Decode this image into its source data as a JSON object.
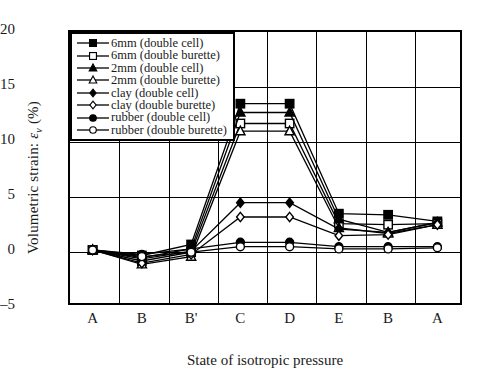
{
  "chart_data": {
    "type": "line",
    "title": "",
    "xlabel": "State of isotropic pressure",
    "ylabel": "Volumetric strain: εv (%)",
    "ylabel_parts": {
      "prefix": "Volumetric strain: ",
      "symbol": "ε",
      "subscript": "v",
      "unit": " (%)"
    },
    "categories": [
      "A",
      "B",
      "B'",
      "C",
      "D",
      "E",
      "B",
      "A"
    ],
    "ylim": [
      -5,
      20
    ],
    "yticks": [
      20,
      15,
      10,
      5,
      0,
      -5
    ],
    "grid": true,
    "legend_position": "top-left",
    "series": [
      {
        "name": "6mm (double cell)",
        "marker": "filled-square",
        "values": [
          0.0,
          -0.5,
          0.5,
          13.3,
          13.3,
          3.3,
          3.2,
          2.6
        ]
      },
      {
        "name": "6mm (double burette)",
        "marker": "open-square",
        "values": [
          0.0,
          -1.0,
          -0.2,
          11.5,
          11.5,
          2.4,
          2.3,
          2.4
        ]
      },
      {
        "name": "2mm (double cell)",
        "marker": "filled-triangle",
        "values": [
          0.0,
          -0.7,
          0.1,
          12.5,
          12.5,
          2.8,
          1.6,
          2.5
        ]
      },
      {
        "name": "2mm (double burette)",
        "marker": "open-triangle",
        "values": [
          0.0,
          -1.3,
          -0.6,
          10.8,
          10.8,
          2.0,
          1.5,
          2.3
        ]
      },
      {
        "name": "clay (double cell)",
        "marker": "filled-diamond",
        "values": [
          0.0,
          -0.8,
          -0.1,
          4.3,
          4.3,
          1.9,
          1.6,
          2.5
        ]
      },
      {
        "name": "clay (double burette)",
        "marker": "open-diamond",
        "values": [
          0.0,
          -1.2,
          -0.4,
          3.0,
          3.0,
          1.3,
          1.4,
          2.3
        ]
      },
      {
        "name": "rubber (double cell)",
        "marker": "filled-circle",
        "values": [
          0.0,
          -0.4,
          0.1,
          0.7,
          0.7,
          0.3,
          0.3,
          0.3
        ]
      },
      {
        "name": "rubber (double burette)",
        "marker": "open-circle",
        "values": [
          0.0,
          -0.6,
          -0.2,
          0.3,
          0.3,
          0.1,
          0.1,
          0.2
        ]
      }
    ]
  }
}
